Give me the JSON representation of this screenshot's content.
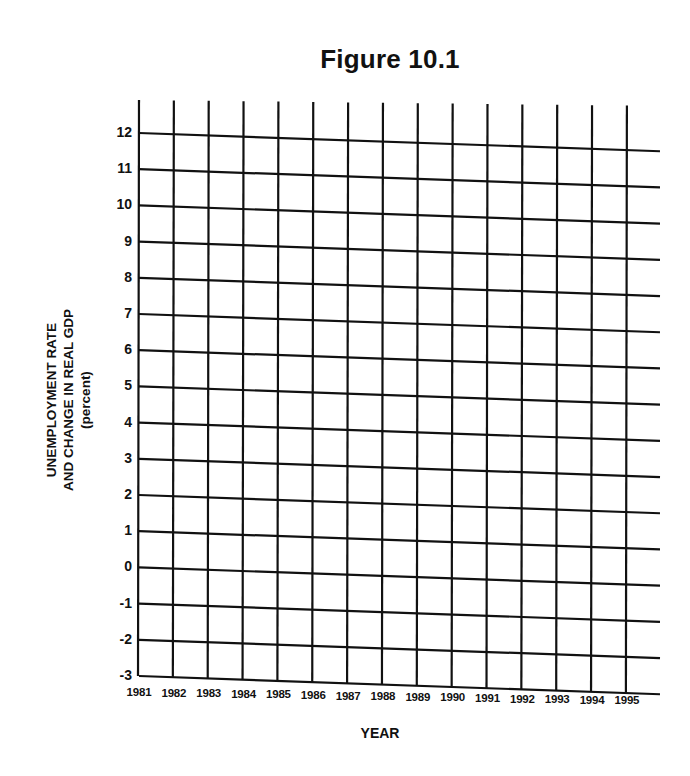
{
  "figure": {
    "title": "Figure 10.1",
    "xaxis_title": "YEAR",
    "yaxis_title_lines": [
      "UNEMPLOYMENT  RATE",
      "AND CHANGE IN REAL GDP",
      "(percent)"
    ]
  },
  "chart_data": {
    "type": "line",
    "title": "Figure 10.1",
    "xlabel": "YEAR",
    "ylabel": "UNEMPLOYMENT RATE AND CHANGE IN REAL GDP (percent)",
    "categories": [
      "1981",
      "1982",
      "1983",
      "1984",
      "1985",
      "1986",
      "1987",
      "1988",
      "1989",
      "1990",
      "1991",
      "1992",
      "1993",
      "1994",
      "1995"
    ],
    "y_ticks": [
      12,
      11,
      10,
      9,
      8,
      7,
      6,
      5,
      4,
      3,
      2,
      1,
      0,
      -1,
      -2,
      -3
    ],
    "ylim": [
      -3,
      12
    ],
    "grid": true,
    "series": [],
    "note": "Blank grid worksheet; no data plotted"
  },
  "colors": {
    "grid": "#111111",
    "background": "#ffffff"
  }
}
